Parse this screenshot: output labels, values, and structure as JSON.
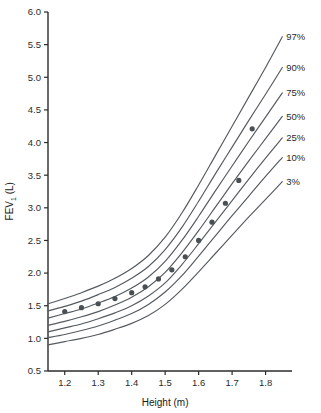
{
  "chart_data": {
    "type": "line",
    "title": "",
    "xlabel": "Height (m)",
    "ylabel": "FEV",
    "ylabel_sub": "1",
    "ylabel_unit": " (L)",
    "xlim": [
      1.15,
      1.87
    ],
    "ylim": [
      0.5,
      6.0
    ],
    "xticks": [
      "1.2",
      "1.3",
      "1.4",
      "1.5",
      "1.6",
      "1.7",
      "1.8"
    ],
    "xtick_values": [
      1.2,
      1.3,
      1.4,
      1.5,
      1.6,
      1.7,
      1.8
    ],
    "yticks": [
      "0.5",
      "1.0",
      "1.5",
      "2.0",
      "2.5",
      "3.0",
      "3.5",
      "4.0",
      "4.5",
      "5.0",
      "5.5",
      "6.0"
    ],
    "ytick_values": [
      0.5,
      1.0,
      1.5,
      2.0,
      2.5,
      3.0,
      3.5,
      4.0,
      4.5,
      5.0,
      5.5,
      6.0
    ],
    "grid": false,
    "legend_position": "right-curve-ends",
    "line_color": "#555a5e",
    "point_color": "#4a4f53",
    "axis_color": "#2b2b2b",
    "background": "#ffffff",
    "series": [
      {
        "name": "97%",
        "label": "97%",
        "x": [
          1.15,
          1.2,
          1.25,
          1.3,
          1.35,
          1.4,
          1.45,
          1.5,
          1.55,
          1.6,
          1.65,
          1.7,
          1.75,
          1.8,
          1.85
        ],
        "values": [
          1.53,
          1.61,
          1.7,
          1.8,
          1.92,
          2.07,
          2.27,
          2.55,
          2.92,
          3.35,
          3.8,
          4.25,
          4.7,
          5.15,
          5.62
        ]
      },
      {
        "name": "90%",
        "label": "90%",
        "x": [
          1.15,
          1.2,
          1.25,
          1.3,
          1.35,
          1.4,
          1.45,
          1.5,
          1.55,
          1.6,
          1.65,
          1.7,
          1.75,
          1.8,
          1.85
        ],
        "values": [
          1.42,
          1.49,
          1.57,
          1.67,
          1.78,
          1.92,
          2.1,
          2.36,
          2.7,
          3.1,
          3.52,
          3.93,
          4.34,
          4.74,
          5.15
        ]
      },
      {
        "name": "75%",
        "label": "75%",
        "x": [
          1.15,
          1.2,
          1.25,
          1.3,
          1.35,
          1.4,
          1.45,
          1.5,
          1.55,
          1.6,
          1.65,
          1.7,
          1.75,
          1.8,
          1.85
        ],
        "values": [
          1.31,
          1.38,
          1.45,
          1.54,
          1.64,
          1.77,
          1.94,
          2.18,
          2.5,
          2.87,
          3.26,
          3.64,
          4.02,
          4.39,
          4.76
        ]
      },
      {
        "name": "50%",
        "label": "50%",
        "x": [
          1.15,
          1.2,
          1.25,
          1.3,
          1.35,
          1.4,
          1.45,
          1.5,
          1.55,
          1.6,
          1.65,
          1.7,
          1.75,
          1.8,
          1.85
        ],
        "values": [
          1.2,
          1.26,
          1.33,
          1.41,
          1.51,
          1.63,
          1.79,
          2.01,
          2.31,
          2.65,
          3.01,
          3.37,
          3.72,
          4.06,
          4.4
        ]
      },
      {
        "name": "25%",
        "label": "25%",
        "x": [
          1.15,
          1.2,
          1.25,
          1.3,
          1.35,
          1.4,
          1.45,
          1.5,
          1.55,
          1.6,
          1.65,
          1.7,
          1.75,
          1.8,
          1.85
        ],
        "values": [
          1.1,
          1.16,
          1.22,
          1.3,
          1.39,
          1.5,
          1.65,
          1.85,
          2.13,
          2.45,
          2.78,
          3.11,
          3.44,
          3.76,
          4.07
        ]
      },
      {
        "name": "10%",
        "label": "10%",
        "x": [
          1.15,
          1.2,
          1.25,
          1.3,
          1.35,
          1.4,
          1.45,
          1.5,
          1.55,
          1.6,
          1.65,
          1.7,
          1.75,
          1.8,
          1.85
        ],
        "values": [
          1.01,
          1.06,
          1.12,
          1.19,
          1.28,
          1.38,
          1.52,
          1.71,
          1.96,
          2.26,
          2.57,
          2.88,
          3.18,
          3.48,
          3.77
        ]
      },
      {
        "name": "3%",
        "label": "3%",
        "x": [
          1.15,
          1.2,
          1.25,
          1.3,
          1.35,
          1.4,
          1.45,
          1.5,
          1.55,
          1.6,
          1.65,
          1.7,
          1.75,
          1.8,
          1.85
        ],
        "values": [
          0.9,
          0.95,
          1.0,
          1.06,
          1.14,
          1.23,
          1.35,
          1.52,
          1.75,
          2.02,
          2.3,
          2.58,
          2.86,
          3.13,
          3.4
        ]
      }
    ],
    "scatter": {
      "name": "measured-subject",
      "x": [
        1.2,
        1.25,
        1.3,
        1.35,
        1.4,
        1.44,
        1.48,
        1.52,
        1.56,
        1.6,
        1.64,
        1.68,
        1.72,
        1.76
      ],
      "y": [
        1.41,
        1.47,
        1.53,
        1.61,
        1.7,
        1.79,
        1.91,
        2.05,
        2.25,
        2.5,
        2.78,
        3.07,
        3.42,
        4.21
      ]
    }
  }
}
